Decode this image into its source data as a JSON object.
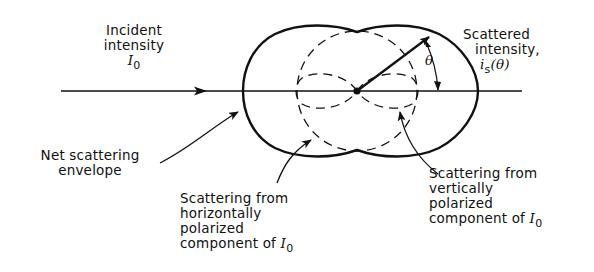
{
  "diagram": {
    "type": "polar scattering pattern (Rayleigh scattering)",
    "labels": {
      "incident": [
        "Incident",
        "intensity"
      ],
      "incident_symbol": "I",
      "incident_subscript": "0",
      "scattered": [
        "Scattered",
        "intensity,"
      ],
      "scattered_symbol": "i",
      "scattered_subscript": "s",
      "scattered_arg": "(θ)",
      "theta": "θ",
      "envelope": [
        "Net scattering",
        "envelope"
      ],
      "horizontal": [
        "Scattering from",
        "horizontally",
        "polarized",
        "component of"
      ],
      "horizontal_symbol": "I",
      "horizontal_subscript": "0",
      "vertical": [
        "Scattering from",
        "vertically",
        "polarized",
        "component of"
      ],
      "vertical_symbol": "I",
      "vertical_subscript": "0"
    },
    "colors": {
      "ink": "#111111",
      "background": "#ffffff"
    }
  }
}
